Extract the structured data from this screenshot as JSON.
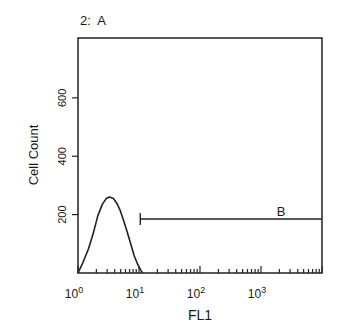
{
  "chart_data": {
    "type": "area",
    "title": "2:  A",
    "xlabel": "FL1",
    "ylabel": "Cell Count",
    "x_scale": "log",
    "xlim": [
      1,
      10000
    ],
    "ylim": [
      0,
      805
    ],
    "x_ticks": [
      {
        "value": 1,
        "base": "10",
        "exp": "0"
      },
      {
        "value": 10,
        "base": "10",
        "exp": "1"
      },
      {
        "value": 100,
        "base": "10",
        "exp": "2"
      },
      {
        "value": 1000,
        "base": "10",
        "exp": "3"
      }
    ],
    "y_ticks": [
      200,
      400,
      600
    ],
    "grid": false,
    "legend": null,
    "series": [
      {
        "name": "FL1 histogram",
        "x": [
          1.0,
          1.2,
          1.5,
          1.8,
          2.1,
          2.5,
          2.9,
          3.3,
          3.8,
          4.3,
          4.9,
          5.6,
          6.4,
          7.3,
          8.3,
          9.5,
          10.8,
          11.5
        ],
        "values": [
          0,
          35,
          85,
          140,
          195,
          235,
          255,
          260,
          255,
          240,
          215,
          180,
          140,
          100,
          60,
          30,
          8,
          0
        ]
      }
    ],
    "annotations": [
      {
        "type": "gate",
        "label": "B",
        "x_start": 10.5,
        "x_end": 10000,
        "y": 185
      }
    ]
  }
}
